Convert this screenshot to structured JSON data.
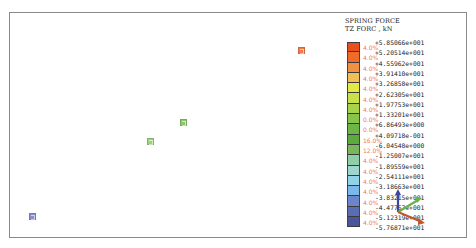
{
  "legend": {
    "title_line1": "SPRING FORCE",
    "title_line2": "TZ FORC , kN",
    "segments": [
      {
        "color": "#e8501e",
        "pct": "4.0%"
      },
      {
        "color": "#f06a2a",
        "pct": "4.0%"
      },
      {
        "color": "#f29044",
        "pct": "4.0%"
      },
      {
        "color": "#f1bf55",
        "pct": "4.0%"
      },
      {
        "color": "#e4e844",
        "pct": "4.0%"
      },
      {
        "color": "#c9e04a",
        "pct": "4.0%"
      },
      {
        "color": "#a7d24a",
        "pct": "4.0%"
      },
      {
        "color": "#86c54a",
        "pct": "0.0%"
      },
      {
        "color": "#6bb646",
        "pct": "0.0%"
      },
      {
        "color": "#5aaa3e",
        "pct": "16.0%"
      },
      {
        "color": "#78b85a",
        "pct": "12.0%"
      },
      {
        "color": "#8fcfa7",
        "pct": "4.0%"
      },
      {
        "color": "#9ed6cf",
        "pct": "4.0%"
      },
      {
        "color": "#92d2e6",
        "pct": "4.0%"
      },
      {
        "color": "#7ab8ea",
        "pct": "4.0%"
      },
      {
        "color": "#6c84c8",
        "pct": "4.0%"
      },
      {
        "color": "#5a6cb2",
        "pct": "4.0%"
      },
      {
        "color": "#4a559c",
        "pct": "4.0%"
      }
    ],
    "values": [
      "+5.85066e+001",
      "+5.20514e+001",
      "+4.55962e+001",
      "+3.91410e+001",
      "+3.26858e+001",
      "+2.62305e+001",
      "+1.97753e+001",
      "+1.33201e+001",
      "+6.86493e+000",
      "+4.09718e-001",
      "-6.04548e+000",
      "-1.25007e+001",
      "-1.89559e+001",
      "-2.54111e+001",
      "-3.18663e+001",
      "-3.83215e+001",
      "-4.47767e+001",
      "-5.12319e+001",
      "-5.76871e+001"
    ]
  },
  "scene": {
    "nodes": [
      {
        "label": "spring-node-orange",
        "x": 298,
        "y": 47,
        "color": "#f07a4a"
      },
      {
        "label": "spring-node-green-1",
        "x": 180,
        "y": 119,
        "color": "#8cc86a"
      },
      {
        "label": "spring-node-green-2",
        "x": 147,
        "y": 138,
        "color": "#9cd27a"
      },
      {
        "label": "spring-node-blue",
        "x": 29,
        "y": 213,
        "color": "#8a8ecc"
      }
    ]
  },
  "axis_triad": {
    "x_color": "#c0582a",
    "y_color": "#6ab24a",
    "z_color": "#3c46a0"
  }
}
